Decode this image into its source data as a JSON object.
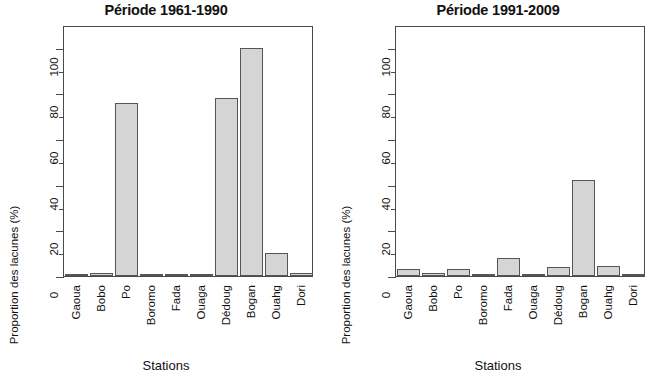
{
  "axis": {
    "ylabel": "Proportion des lacunes (%)",
    "xlabel": "Stations",
    "ytick_labels": [
      "0",
      "20",
      "40",
      "60",
      "80",
      "100"
    ]
  },
  "panels": [
    {
      "title": "Période 1961-1990"
    },
    {
      "title": "Période 1991-2009"
    }
  ],
  "chart_data": [
    {
      "type": "bar",
      "title": "Période 1961-1990",
      "xlabel": "Stations",
      "ylabel": "Proportion des lacunes (%)",
      "categories": [
        "Gaoua",
        "Bobo",
        "Po",
        "Boromo",
        "Fada",
        "Ouaga",
        "Dédoug",
        "Bogan",
        "Ouahg",
        "Dori"
      ],
      "values": [
        0.5,
        1.2,
        76,
        0.5,
        1,
        1,
        78,
        100,
        10,
        1.5
      ],
      "ylim": [
        0,
        110
      ],
      "yticks": [
        0,
        20,
        40,
        60,
        80,
        100
      ],
      "yticks_minor": [
        10,
        30,
        50,
        70,
        90
      ],
      "grid": false,
      "legend": null,
      "bar_fill": "#d5d5d5",
      "bar_border": "#555555"
    },
    {
      "type": "bar",
      "title": "Période 1991-2009",
      "xlabel": "Stations",
      "ylabel": "Proportion des lacunes (%)",
      "categories": [
        "Gaoua",
        "Bobo",
        "Po",
        "Boromo",
        "Fada",
        "Ouaga",
        "Dédoug",
        "Bogan",
        "Ouahg",
        "Dori"
      ],
      "values": [
        3,
        1.5,
        3,
        0.5,
        8,
        0.5,
        4,
        42,
        4.5,
        0.5
      ],
      "ylim": [
        0,
        110
      ],
      "yticks": [
        0,
        20,
        40,
        60,
        80,
        100
      ],
      "yticks_minor": [
        10,
        30,
        50,
        70,
        90
      ],
      "grid": false,
      "legend": null,
      "bar_fill": "#d5d5d5",
      "bar_border": "#555555"
    }
  ]
}
